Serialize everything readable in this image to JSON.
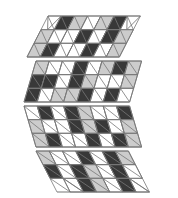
{
  "figure": {
    "canvas": {
      "width": 178,
      "height": 198,
      "background": "#ffffff"
    },
    "palette": {
      "white": "#ffffff",
      "light": "#cccccc",
      "dark": "#383838",
      "stroke": "#777777",
      "background": "#ffffff"
    },
    "geometry": {
      "unit": 13,
      "band_height": 41,
      "band_gap": 4,
      "left": 23,
      "right": 155,
      "top": 15,
      "bottom": 195
    },
    "bands": [
      {
        "name": "band-1",
        "shape": "trapezoid-down",
        "y_top": 16,
        "y_bottom": 57,
        "x_top_left": 48,
        "x_top_right": 131,
        "x_bottom_left": 27,
        "x_bottom_right": 152,
        "tile_count": 26
      },
      {
        "name": "band-2",
        "shape": "trapezoid-down",
        "y_top": 61,
        "y_bottom": 102,
        "x_top_left": 36,
        "x_top_right": 143,
        "x_bottom_left": 24,
        "x_bottom_right": 156,
        "tile_count": 34
      },
      {
        "name": "band-3",
        "shape": "trapezoid-up",
        "y_top": 106,
        "y_bottom": 147,
        "x_top_left": 24,
        "x_top_right": 156,
        "x_bottom_left": 36,
        "x_bottom_right": 143,
        "tile_count": 34
      },
      {
        "name": "band-4",
        "shape": "trapezoid-up",
        "y_top": 151,
        "y_bottom": 192,
        "x_top_left": 36,
        "x_top_right": 143,
        "x_bottom_left": 56,
        "x_bottom_right": 122,
        "tile_count": 20
      }
    ],
    "tiles": {
      "band1": [
        {
          "type": "tri-up",
          "col": 0,
          "row": 0,
          "fill": "white"
        },
        {
          "type": "rhomb-left",
          "col": 1,
          "row": 0,
          "fill": "dark"
        },
        {
          "type": "rhomb-right",
          "col": 2,
          "row": 0,
          "fill": "light"
        },
        {
          "type": "rhomb-left",
          "col": 3,
          "row": 0,
          "fill": "white"
        },
        {
          "type": "rhomb-right",
          "col": 4,
          "row": 0,
          "fill": "light"
        },
        {
          "type": "rhomb-left",
          "col": 5,
          "row": 0,
          "fill": "dark"
        },
        {
          "type": "tri-up",
          "col": 6,
          "row": 0,
          "fill": "white"
        },
        {
          "type": "rhomb-right",
          "col": 0,
          "row": 1,
          "fill": "light"
        },
        {
          "type": "rhomb-left",
          "col": 1,
          "row": 1,
          "fill": "white"
        },
        {
          "type": "rhomb-right",
          "col": 2,
          "row": 1,
          "fill": "white"
        },
        {
          "type": "rhomb-left",
          "col": 3,
          "row": 1,
          "fill": "dark"
        },
        {
          "type": "rhomb-right",
          "col": 4,
          "row": 1,
          "fill": "white"
        },
        {
          "type": "rhomb-left",
          "col": 5,
          "row": 1,
          "fill": "dark"
        },
        {
          "type": "rhomb-right",
          "col": 6,
          "row": 1,
          "fill": "light"
        },
        {
          "type": "rhomb-left",
          "col": 0,
          "row": 2,
          "fill": "light"
        },
        {
          "type": "rhomb-right",
          "col": 1,
          "row": 2,
          "fill": "dark"
        },
        {
          "type": "rhomb-left",
          "col": 2,
          "row": 2,
          "fill": "white"
        },
        {
          "type": "rhomb-right",
          "col": 3,
          "row": 2,
          "fill": "white"
        },
        {
          "type": "rhomb-left",
          "col": 4,
          "row": 2,
          "fill": "dark"
        },
        {
          "type": "rhomb-right",
          "col": 5,
          "row": 2,
          "fill": "white"
        },
        {
          "type": "rhomb-left",
          "col": 6,
          "row": 2,
          "fill": "light"
        }
      ],
      "band2": [
        {
          "type": "rhomb-right",
          "col": 0,
          "row": 0,
          "fill": "light"
        },
        {
          "type": "rhomb-left",
          "col": 1,
          "row": 0,
          "fill": "white"
        },
        {
          "type": "rhomb-right",
          "col": 2,
          "row": 0,
          "fill": "white"
        },
        {
          "type": "rhomb-left",
          "col": 3,
          "row": 0,
          "fill": "dark"
        },
        {
          "type": "rhomb-right",
          "col": 4,
          "row": 0,
          "fill": "white"
        },
        {
          "type": "rhomb-left",
          "col": 5,
          "row": 0,
          "fill": "light"
        },
        {
          "type": "rhomb-right",
          "col": 6,
          "row": 0,
          "fill": "dark"
        },
        {
          "type": "rhomb-left",
          "col": 7,
          "row": 0,
          "fill": "light"
        },
        {
          "type": "rhomb-left",
          "col": 0,
          "row": 1,
          "fill": "dark"
        },
        {
          "type": "rhomb-right",
          "col": 1,
          "row": 1,
          "fill": "dark"
        },
        {
          "type": "rhomb-left",
          "col": 2,
          "row": 1,
          "fill": "white"
        },
        {
          "type": "rhomb-right",
          "col": 3,
          "row": 1,
          "fill": "dark"
        },
        {
          "type": "rhomb-left",
          "col": 4,
          "row": 1,
          "fill": "light"
        },
        {
          "type": "rhomb-right",
          "col": 5,
          "row": 1,
          "fill": "white"
        },
        {
          "type": "rhomb-left",
          "col": 6,
          "row": 1,
          "fill": "white"
        },
        {
          "type": "rhomb-right",
          "col": 7,
          "row": 1,
          "fill": "light"
        },
        {
          "type": "rhomb-right",
          "col": 0,
          "row": 2,
          "fill": "dark"
        },
        {
          "type": "rhomb-left",
          "col": 1,
          "row": 2,
          "fill": "white"
        },
        {
          "type": "rhomb-right",
          "col": 2,
          "row": 2,
          "fill": "light"
        },
        {
          "type": "rhomb-left",
          "col": 3,
          "row": 2,
          "fill": "light"
        },
        {
          "type": "rhomb-right",
          "col": 4,
          "row": 2,
          "fill": "dark"
        },
        {
          "type": "rhomb-left",
          "col": 5,
          "row": 2,
          "fill": "white"
        },
        {
          "type": "rhomb-right",
          "col": 6,
          "row": 2,
          "fill": "dark"
        },
        {
          "type": "rhomb-left",
          "col": 7,
          "row": 2,
          "fill": "white"
        }
      ],
      "band3": [
        {
          "type": "rhomb-left",
          "col": 0,
          "row": 0,
          "fill": "white"
        },
        {
          "type": "rhomb-right",
          "col": 1,
          "row": 0,
          "fill": "dark"
        },
        {
          "type": "rhomb-left",
          "col": 2,
          "row": 0,
          "fill": "white"
        },
        {
          "type": "rhomb-right",
          "col": 3,
          "row": 0,
          "fill": "dark"
        },
        {
          "type": "rhomb-left",
          "col": 4,
          "row": 0,
          "fill": "light"
        },
        {
          "type": "rhomb-right",
          "col": 5,
          "row": 0,
          "fill": "white"
        },
        {
          "type": "rhomb-left",
          "col": 6,
          "row": 0,
          "fill": "white"
        },
        {
          "type": "rhomb-right",
          "col": 7,
          "row": 0,
          "fill": "dark"
        },
        {
          "type": "rhomb-right",
          "col": 0,
          "row": 1,
          "fill": "light"
        },
        {
          "type": "rhomb-left",
          "col": 1,
          "row": 1,
          "fill": "white"
        },
        {
          "type": "rhomb-right",
          "col": 2,
          "row": 1,
          "fill": "white"
        },
        {
          "type": "rhomb-left",
          "col": 3,
          "row": 1,
          "fill": "dark"
        },
        {
          "type": "rhomb-right",
          "col": 4,
          "row": 1,
          "fill": "light"
        },
        {
          "type": "rhomb-left",
          "col": 5,
          "row": 1,
          "fill": "dark"
        },
        {
          "type": "rhomb-right",
          "col": 6,
          "row": 1,
          "fill": "white"
        },
        {
          "type": "rhomb-left",
          "col": 7,
          "row": 1,
          "fill": "light"
        },
        {
          "type": "rhomb-left",
          "col": 0,
          "row": 2,
          "fill": "light"
        },
        {
          "type": "rhomb-right",
          "col": 1,
          "row": 2,
          "fill": "dark"
        },
        {
          "type": "rhomb-left",
          "col": 2,
          "row": 2,
          "fill": "white"
        },
        {
          "type": "rhomb-right",
          "col": 3,
          "row": 2,
          "fill": "white"
        },
        {
          "type": "rhomb-left",
          "col": 4,
          "row": 2,
          "fill": "dark"
        },
        {
          "type": "rhomb-right",
          "col": 5,
          "row": 2,
          "fill": "white"
        },
        {
          "type": "rhomb-left",
          "col": 6,
          "row": 2,
          "fill": "dark"
        },
        {
          "type": "rhomb-right",
          "col": 7,
          "row": 2,
          "fill": "light"
        }
      ],
      "band4": [
        {
          "type": "rhomb-right",
          "col": 0,
          "row": 0,
          "fill": "light"
        },
        {
          "type": "rhomb-left",
          "col": 1,
          "row": 0,
          "fill": "white"
        },
        {
          "type": "rhomb-right",
          "col": 2,
          "row": 0,
          "fill": "white"
        },
        {
          "type": "rhomb-left",
          "col": 3,
          "row": 0,
          "fill": "dark"
        },
        {
          "type": "rhomb-right",
          "col": 4,
          "row": 0,
          "fill": "white"
        },
        {
          "type": "rhomb-left",
          "col": 5,
          "row": 0,
          "fill": "dark"
        },
        {
          "type": "rhomb-right",
          "col": 6,
          "row": 0,
          "fill": "light"
        },
        {
          "type": "rhomb-left",
          "col": 0,
          "row": 1,
          "fill": "dark"
        },
        {
          "type": "rhomb-right",
          "col": 1,
          "row": 1,
          "fill": "white"
        },
        {
          "type": "rhomb-left",
          "col": 2,
          "row": 1,
          "fill": "dark"
        },
        {
          "type": "rhomb-right",
          "col": 3,
          "row": 1,
          "fill": "light"
        },
        {
          "type": "rhomb-left",
          "col": 4,
          "row": 1,
          "fill": "white"
        },
        {
          "type": "rhomb-right",
          "col": 5,
          "row": 1,
          "fill": "dark"
        },
        {
          "type": "rhomb-left",
          "col": 6,
          "row": 1,
          "fill": "white"
        },
        {
          "type": "tri-down",
          "col": 1,
          "row": 2,
          "fill": "white"
        },
        {
          "type": "rhomb-right",
          "col": 2,
          "row": 2,
          "fill": "dark"
        },
        {
          "type": "rhomb-left",
          "col": 3,
          "row": 2,
          "fill": "light"
        },
        {
          "type": "rhomb-right",
          "col": 4,
          "row": 2,
          "fill": "white"
        },
        {
          "type": "rhomb-left",
          "col": 5,
          "row": 2,
          "fill": "dark"
        },
        {
          "type": "tri-down",
          "col": 6,
          "row": 2,
          "fill": "white"
        }
      ]
    }
  }
}
